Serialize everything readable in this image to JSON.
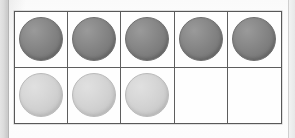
{
  "worksheet": {
    "kind": "ten-frame",
    "description": "Ten frame with counters",
    "columns": 5,
    "rows": 2,
    "total_cells": 10,
    "filled_count": 8,
    "empty_count": 2,
    "frame_border_color": "#585858",
    "grid_line_color": "#5e5e5e",
    "page_background_color": "#fdfdfd",
    "counter_colors": {
      "dark": "#7f7f7f",
      "light": "#d2d2d2",
      "empty": "#ffffff"
    },
    "cells": [
      {
        "index": 1,
        "row": 1,
        "column": 1,
        "state": "filled",
        "counter": "dark",
        "label": "counter-dark-1"
      },
      {
        "index": 2,
        "row": 1,
        "column": 2,
        "state": "filled",
        "counter": "dark",
        "label": "counter-dark-2"
      },
      {
        "index": 3,
        "row": 1,
        "column": 3,
        "state": "filled",
        "counter": "dark",
        "label": "counter-dark-3"
      },
      {
        "index": 4,
        "row": 1,
        "column": 4,
        "state": "filled",
        "counter": "dark",
        "label": "counter-dark-4"
      },
      {
        "index": 5,
        "row": 1,
        "column": 5,
        "state": "filled",
        "counter": "dark",
        "label": "counter-dark-5"
      },
      {
        "index": 6,
        "row": 2,
        "column": 1,
        "state": "filled",
        "counter": "light",
        "label": "counter-light-1"
      },
      {
        "index": 7,
        "row": 2,
        "column": 2,
        "state": "filled",
        "counter": "light",
        "label": "counter-light-2"
      },
      {
        "index": 8,
        "row": 2,
        "column": 3,
        "state": "filled",
        "counter": "light",
        "label": "counter-light-3"
      },
      {
        "index": 9,
        "row": 2,
        "column": 4,
        "state": "empty",
        "counter": "empty",
        "label": "empty-cell-1"
      },
      {
        "index": 10,
        "row": 2,
        "column": 5,
        "state": "empty",
        "counter": "empty",
        "label": "empty-cell-2"
      }
    ]
  },
  "page": {
    "left_edge_shadow_color": "#d2d2d2",
    "right_edge_line_color": "#cfcfcf"
  }
}
